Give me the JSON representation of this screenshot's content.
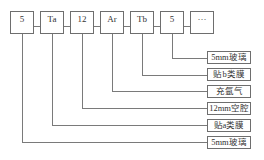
{
  "diagram": {
    "type": "glass-structure-legend",
    "top_boxes": [
      {
        "label": "5",
        "target_label_index": 5
      },
      {
        "label": "Ta",
        "target_label_index": 4
      },
      {
        "label": "12",
        "target_label_index": 3
      },
      {
        "label": "Ar",
        "target_label_index": 2
      },
      {
        "label": "Tb",
        "target_label_index": 1
      },
      {
        "label": "5",
        "target_label_index": 0
      },
      {
        "label": "···",
        "target_label_index": null
      }
    ],
    "labels": [
      {
        "text": "5mm玻璃"
      },
      {
        "text": "贴b类膜"
      },
      {
        "text": "充氩气"
      },
      {
        "text": "12mm空腔"
      },
      {
        "text": "贴a类膜"
      },
      {
        "text": "5mm玻璃"
      }
    ],
    "line_color": "#7a7a7a",
    "border_color": "#6e6e6e"
  }
}
